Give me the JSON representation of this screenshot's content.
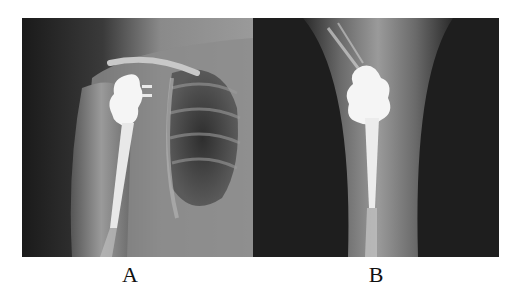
{
  "figure": {
    "panels": [
      {
        "id": "A",
        "label": "A",
        "description": "Anteroposterior shoulder radiograph with humeral endoprosthesis and lung field visible"
      },
      {
        "id": "B",
        "label": "B",
        "description": "Lateral/axial view of upper arm with humeral endoprosthesis and intramedullary stem"
      }
    ]
  }
}
